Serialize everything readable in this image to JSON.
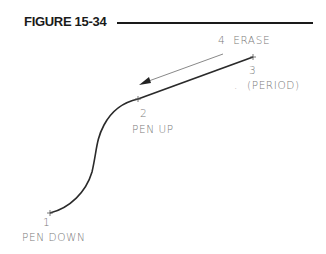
{
  "figure": {
    "title": "FIGURE 15-34"
  },
  "diagram": {
    "points": [
      {
        "number": "1",
        "label": "PEN DOWN"
      },
      {
        "number": "2",
        "label": "PEN UP"
      },
      {
        "number": "3",
        "label": "(PERIOD)",
        "key": "."
      }
    ],
    "arrow": {
      "label": "4  ERASE"
    }
  },
  "colors": {
    "line": "#2a2a2a",
    "label": "#7a7a7a",
    "title": "#1a1a1a"
  }
}
